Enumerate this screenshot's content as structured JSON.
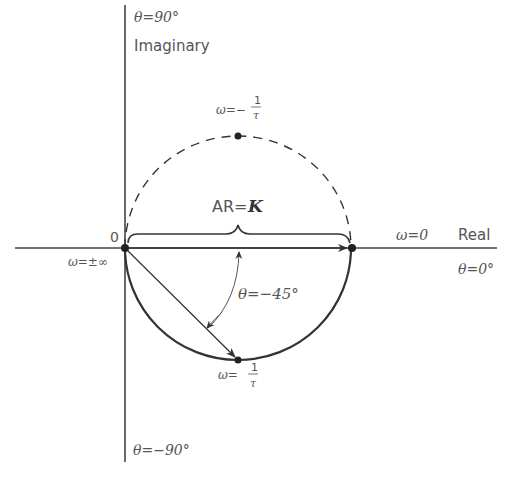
{
  "diagram": {
    "axes": {
      "vertical": {
        "name": "Imaginary",
        "top_angle": "θ=90°",
        "bottom_angle": "θ=−90°"
      },
      "horizontal": {
        "name": "Real",
        "right_angle": "θ=0°"
      }
    },
    "origin_label": "0",
    "points": [
      {
        "id": "origin",
        "omega_label": "ω=±∞"
      },
      {
        "id": "real-intercept",
        "omega_label": "ω=0"
      },
      {
        "id": "top",
        "omega_prefix": "ω=−",
        "fraction_num": "1",
        "fraction_den": "τ"
      },
      {
        "id": "bottom",
        "omega_prefix": "ω=",
        "fraction_num": "1",
        "fraction_den": "τ"
      }
    ],
    "amplitude_ratio": {
      "prefix": "AR=",
      "symbol": "K"
    },
    "phase_angle": "θ=−45°",
    "circle_style": {
      "upper_half": "dashed",
      "lower_half": "solid"
    },
    "colors": {
      "line": "#333333",
      "text": "#555555"
    }
  }
}
